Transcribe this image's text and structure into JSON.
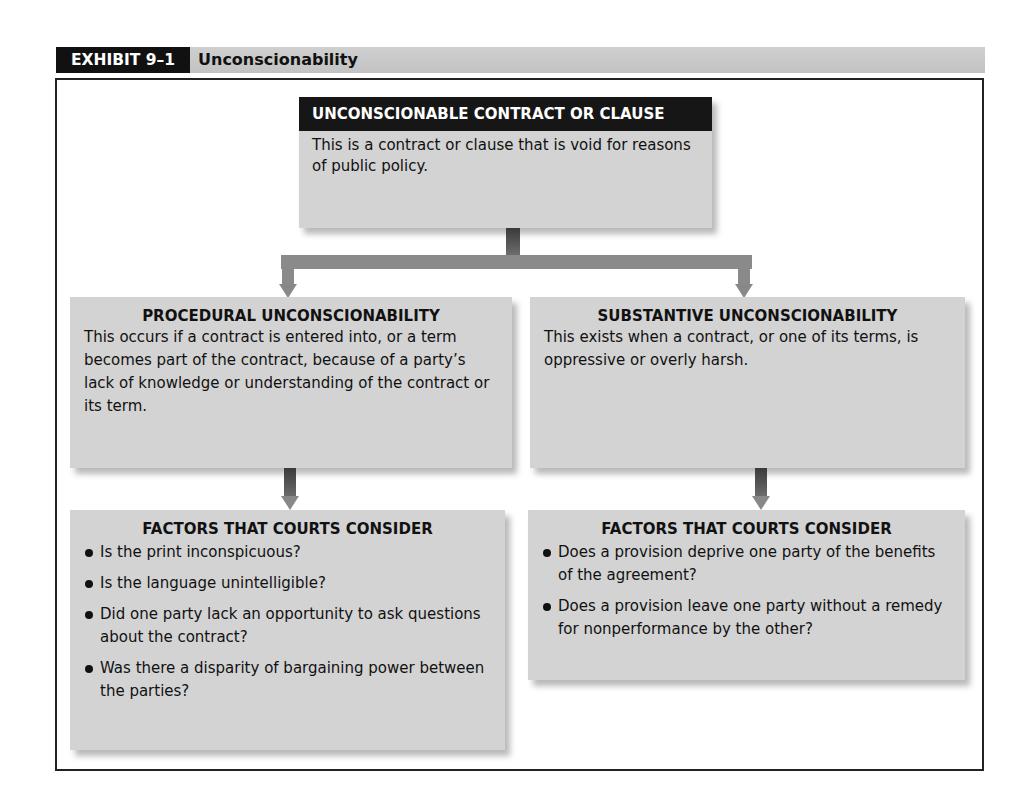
{
  "exhibit": {
    "badge": "EXHIBIT 9–1",
    "title": "Unconscionability"
  },
  "top_box": {
    "heading": "UNCONSCIONABLE CONTRACT OR CLAUSE",
    "text": "This is a contract or clause that is void for reasons of public policy."
  },
  "procedural": {
    "heading": "PROCEDURAL UNCONSCIONABILITY",
    "text": "This occurs if a contract is entered into, or a term becomes part of the contract, because of a party’s lack of knowledge or understanding of the contract or its term.",
    "factors_heading": "FACTORS THAT COURTS CONSIDER",
    "factors": [
      "Is the print inconspicuous?",
      "Is the language unintelligible?",
      "Did one party lack an opportunity to ask questions about the contract?",
      "Was there a disparity of bargaining power between the parties?"
    ]
  },
  "substantive": {
    "heading": "SUBSTANTIVE UNCONSCIONABILITY",
    "text": "This exists when a contract, or one of its terms, is oppressive or overly harsh.",
    "factors_heading": "FACTORS THAT COURTS CONSIDER",
    "factors": [
      "Does a provision deprive one party of the benefits of the agreement?",
      "Does a provision leave one party without a remedy for nonperformance by the other?"
    ]
  },
  "colors": {
    "header_dark": "#161616",
    "box_fill": "#d3d3d3",
    "connector": "#8a8a8a",
    "title_bar": "#c8c8c8"
  }
}
